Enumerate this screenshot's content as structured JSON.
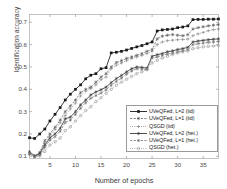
{
  "chart_data": {
    "type": "line",
    "title": "",
    "xlabel": "Number of epochs",
    "ylabel": "Identification accuracy",
    "xlim": [
      1,
      38
    ],
    "ylim": [
      0.09,
      0.735
    ],
    "xticks": [
      5,
      10,
      15,
      20,
      25,
      30,
      35
    ],
    "yticks": [
      0.1,
      0.2,
      0.3,
      0.4,
      0.5,
      0.6,
      0.7
    ],
    "ytick_labels": [
      "0.1",
      "0.2",
      "0.3",
      "0.4",
      "0.5",
      "0.6",
      "0.7"
    ],
    "xtick_labels": [
      "5",
      "10",
      "15",
      "20",
      "25",
      "30",
      "35"
    ],
    "grid": false,
    "legend_position": "lower right",
    "x": [
      1,
      2,
      3,
      4,
      5,
      6,
      7,
      8,
      9,
      10,
      11,
      12,
      13,
      14,
      15,
      16,
      17,
      18,
      19,
      20,
      21,
      22,
      23,
      24,
      25,
      26,
      27,
      28,
      29,
      30,
      31,
      32,
      33,
      34,
      35,
      36,
      37,
      38
    ],
    "series": [
      {
        "name": "UVeQFed, L=2 (iid)",
        "linestyle": "solid",
        "marker": "square-filled",
        "color": "#1a1a1a",
        "values": [
          0.183,
          0.18,
          0.2,
          0.222,
          0.258,
          0.288,
          0.318,
          0.352,
          0.378,
          0.4,
          0.42,
          0.447,
          0.463,
          0.47,
          0.492,
          0.497,
          0.563,
          0.566,
          0.57,
          0.576,
          0.583,
          0.59,
          0.596,
          0.604,
          0.612,
          0.661,
          0.666,
          0.668,
          0.67,
          0.676,
          0.679,
          0.684,
          0.712,
          0.713,
          0.713,
          0.714,
          0.714,
          0.715
        ]
      },
      {
        "name": "UVeQFed, L=1 (iid)",
        "linestyle": "dashed",
        "marker": "star",
        "color": "#555555",
        "values": [
          0.113,
          0.1,
          0.117,
          0.17,
          0.2,
          0.23,
          0.262,
          0.3,
          0.325,
          0.352,
          0.385,
          0.4,
          0.41,
          0.432,
          0.455,
          0.47,
          0.5,
          0.52,
          0.528,
          0.538,
          0.545,
          0.552,
          0.56,
          0.57,
          0.578,
          0.626,
          0.638,
          0.642,
          0.645,
          0.642,
          0.64,
          0.645,
          0.67,
          0.676,
          0.68,
          0.684,
          0.687,
          0.69
        ]
      },
      {
        "name": "QSGD (iid)",
        "linestyle": "dotted",
        "marker": "plus",
        "color": "#777777",
        "values": [
          0.108,
          0.1,
          0.112,
          0.16,
          0.192,
          0.22,
          0.25,
          0.283,
          0.312,
          0.338,
          0.37,
          0.392,
          0.403,
          0.42,
          0.443,
          0.455,
          0.492,
          0.508,
          0.518,
          0.528,
          0.538,
          0.545,
          0.552,
          0.56,
          0.57,
          0.6,
          0.612,
          0.618,
          0.62,
          0.622,
          0.623,
          0.625,
          0.64,
          0.648,
          0.655,
          0.662,
          0.667,
          0.67
        ]
      },
      {
        "name": "UVeQFed, L=2 (het.)",
        "linestyle": "solid",
        "marker": "star",
        "color": "#3a3a3a",
        "values": [
          0.12,
          0.102,
          0.112,
          0.15,
          0.182,
          0.2,
          0.225,
          0.268,
          0.275,
          0.3,
          0.33,
          0.352,
          0.375,
          0.388,
          0.398,
          0.41,
          0.43,
          0.448,
          0.462,
          0.478,
          0.492,
          0.5,
          0.498,
          0.495,
          0.548,
          0.555,
          0.56,
          0.568,
          0.572,
          0.578,
          0.582,
          0.588,
          0.612,
          0.616,
          0.619,
          0.622,
          0.624,
          0.626
        ]
      },
      {
        "name": "UVeQFed, L=1 (het.)",
        "linestyle": "dashed",
        "marker": "star",
        "color": "#6a6a6a",
        "values": [
          0.112,
          0.098,
          0.105,
          0.14,
          0.172,
          0.188,
          0.212,
          0.252,
          0.262,
          0.288,
          0.315,
          0.34,
          0.36,
          0.372,
          0.383,
          0.398,
          0.418,
          0.435,
          0.45,
          0.468,
          0.482,
          0.492,
          0.49,
          0.488,
          0.54,
          0.545,
          0.552,
          0.558,
          0.562,
          0.568,
          0.572,
          0.578,
          0.6,
          0.604,
          0.607,
          0.61,
          0.612,
          0.614
        ]
      },
      {
        "name": "QSGD (het.)",
        "linestyle": "dotted",
        "marker": "circle",
        "color": "#8a8a8a",
        "values": [
          0.11,
          0.098,
          0.102,
          0.122,
          0.15,
          0.165,
          0.182,
          0.215,
          0.232,
          0.258,
          0.282,
          0.305,
          0.322,
          0.345,
          0.362,
          0.382,
          0.4,
          0.418,
          0.432,
          0.445,
          0.458,
          0.47,
          0.478,
          0.49,
          0.518,
          0.53,
          0.54,
          0.548,
          0.556,
          0.562,
          0.568,
          0.572,
          0.582,
          0.586,
          0.59,
          0.592,
          0.594,
          0.596
        ]
      }
    ]
  },
  "legend": {
    "items": [
      {
        "label": "UVeQFed, L=2 (iid)"
      },
      {
        "label": "UVeQFed, L=1 (iid)"
      },
      {
        "label": "QSGD (iid)"
      },
      {
        "label": "UVeQFed, L=2 (het.)"
      },
      {
        "label": "UVeQFed, L=1 (het.)"
      },
      {
        "label": "QSGD (het.)"
      }
    ]
  },
  "axes": {
    "xlabel": "Number of epochs",
    "ylabel": "Identification accuracy"
  }
}
